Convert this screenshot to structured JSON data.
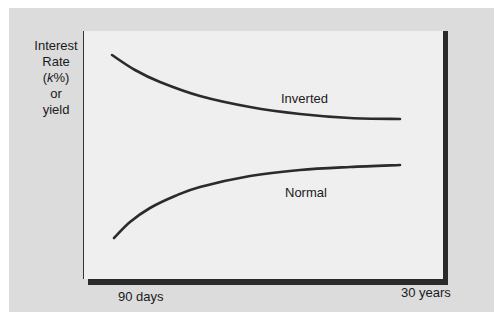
{
  "chart_data": {
    "type": "line",
    "title": "",
    "xlabel": "",
    "ylabel": "Interest Rate (k%) or yield",
    "ylabel_lines": [
      "Interest",
      "Rate",
      "(k%)",
      "or",
      "yield"
    ],
    "x_ticks": [
      "90 days",
      "30 years"
    ],
    "grid": false,
    "series": [
      {
        "name": "Inverted",
        "description": "Downward-sloping yield curve: high short-term rates declining toward lower long-term rates",
        "points": [
          [
            112,
            55
          ],
          [
            135,
            70
          ],
          [
            160,
            82
          ],
          [
            200,
            96
          ],
          [
            250,
            107
          ],
          [
            300,
            114
          ],
          [
            350,
            118
          ],
          [
            400,
            119
          ]
        ]
      },
      {
        "name": "Normal",
        "description": "Upward-sloping yield curve: low short-term rates rising toward higher long-term rates",
        "points": [
          [
            114,
            238
          ],
          [
            130,
            222
          ],
          [
            150,
            208
          ],
          [
            175,
            196
          ],
          [
            200,
            187
          ],
          [
            250,
            176
          ],
          [
            300,
            170
          ],
          [
            350,
            167
          ],
          [
            400,
            165
          ]
        ]
      }
    ]
  },
  "labels": {
    "y_axis": {
      "line1": "Interest",
      "line2": "Rate",
      "line3_open": "(",
      "line3_italic": "k",
      "line3_close": "%)",
      "line4": "or",
      "line5": "yield"
    },
    "x_start": "90 days",
    "x_end": "30 years",
    "inverted": "Inverted",
    "normal": "Normal"
  },
  "colors": {
    "panel": "#dcdcdc",
    "plot_area": "#efefef",
    "curve": "#2b2b2b",
    "shadow": "#2a2a2a"
  }
}
